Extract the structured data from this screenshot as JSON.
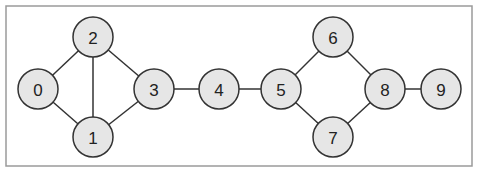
{
  "diagram": {
    "type": "undirected-graph",
    "frame": {
      "x": 6,
      "y": 6,
      "width": 466,
      "height": 160,
      "stroke": "#9a9a9a"
    },
    "style": {
      "node_fill": "#e6e6e6",
      "node_stroke": "#333333",
      "edge_color": "#333333",
      "node_radius": 20
    },
    "nodes": [
      {
        "id": "0",
        "label": "0",
        "x": 38,
        "y": 89
      },
      {
        "id": "1",
        "label": "1",
        "x": 93,
        "y": 137
      },
      {
        "id": "2",
        "label": "2",
        "x": 93,
        "y": 37
      },
      {
        "id": "3",
        "label": "3",
        "x": 154,
        "y": 89
      },
      {
        "id": "4",
        "label": "4",
        "x": 219,
        "y": 89
      },
      {
        "id": "5",
        "label": "5",
        "x": 281,
        "y": 89
      },
      {
        "id": "6",
        "label": "6",
        "x": 333,
        "y": 37
      },
      {
        "id": "7",
        "label": "7",
        "x": 333,
        "y": 137
      },
      {
        "id": "8",
        "label": "8",
        "x": 385,
        "y": 89
      },
      {
        "id": "9",
        "label": "9",
        "x": 441,
        "y": 89
      }
    ],
    "edges": [
      [
        "0",
        "2"
      ],
      [
        "0",
        "1"
      ],
      [
        "2",
        "1"
      ],
      [
        "2",
        "3"
      ],
      [
        "1",
        "3"
      ],
      [
        "3",
        "4"
      ],
      [
        "4",
        "5"
      ],
      [
        "5",
        "6"
      ],
      [
        "5",
        "7"
      ],
      [
        "6",
        "8"
      ],
      [
        "7",
        "8"
      ],
      [
        "8",
        "9"
      ]
    ]
  }
}
